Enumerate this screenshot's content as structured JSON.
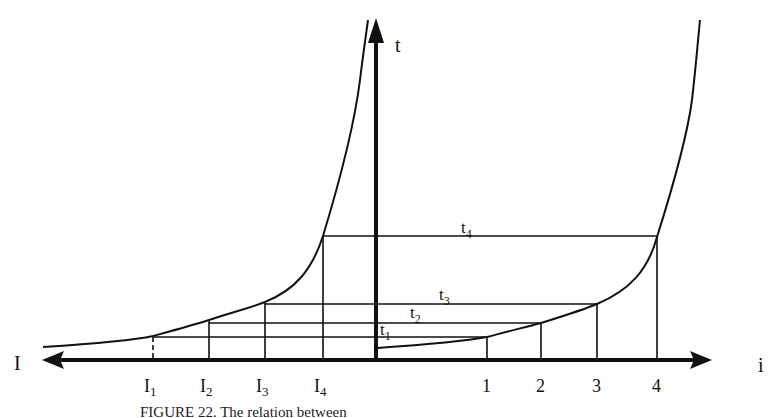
{
  "figure": {
    "axes": {
      "vertical_label": "t",
      "left_label": "I",
      "right_label": "i"
    },
    "left_ticks": [
      {
        "label": "I",
        "sub": "1",
        "x": 153,
        "dashed": true
      },
      {
        "label": "I",
        "sub": "2",
        "x": 209,
        "dashed": false
      },
      {
        "label": "I",
        "sub": "3",
        "x": 265,
        "dashed": false
      },
      {
        "label": "I",
        "sub": "4",
        "x": 323,
        "dashed": false
      }
    ],
    "right_ticks": [
      {
        "label": "1",
        "x": 487
      },
      {
        "label": "2",
        "x": 541
      },
      {
        "label": "3",
        "x": 597
      },
      {
        "label": "4",
        "x": 657
      }
    ],
    "levels": [
      {
        "label": "t",
        "sub": "1",
        "y": 337
      },
      {
        "label": "t",
        "sub": "2",
        "y": 323
      },
      {
        "label": "t",
        "sub": "3",
        "y": 304
      },
      {
        "label": "t",
        "sub": "4",
        "y": 236
      }
    ],
    "caption": "FIGURE 22. The relation between"
  }
}
